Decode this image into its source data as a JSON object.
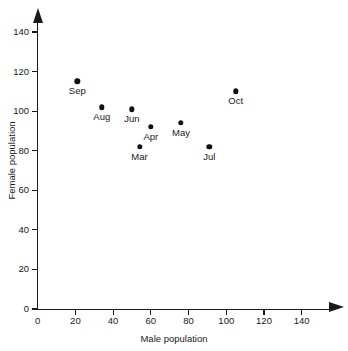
{
  "chart_data": {
    "type": "scatter",
    "title": "",
    "xlabel": "Male population",
    "ylabel": "Female population",
    "xlim": [
      0,
      155
    ],
    "ylim": [
      0,
      148
    ],
    "grid": false,
    "legend": "none",
    "x_ticks": [
      0,
      20,
      40,
      60,
      80,
      100,
      120,
      140
    ],
    "y_ticks": [
      0,
      20,
      40,
      60,
      80,
      100,
      120,
      140
    ],
    "x_tick_labels": [
      "0",
      "20",
      "40",
      "60",
      "80",
      "100",
      "120",
      "140"
    ],
    "y_tick_labels": [
      "0",
      "20",
      "40",
      "60",
      "80",
      "100",
      "120",
      "140"
    ],
    "points": [
      {
        "label": "Sep",
        "x": 21,
        "y": 115,
        "label_pos": "below"
      },
      {
        "label": "Aug",
        "x": 34,
        "y": 102,
        "label_pos": "below"
      },
      {
        "label": "Jun",
        "x": 50,
        "y": 101,
        "label_pos": "below"
      },
      {
        "label": "Apr",
        "x": 60,
        "y": 92,
        "label_pos": "below"
      },
      {
        "label": "Mar",
        "x": 54,
        "y": 82,
        "label_pos": "below"
      },
      {
        "label": "May",
        "x": 76,
        "y": 94,
        "label_pos": "below"
      },
      {
        "label": "Jul",
        "x": 91,
        "y": 82,
        "label_pos": "below"
      },
      {
        "label": "Oct",
        "x": 105,
        "y": 110,
        "label_pos": "below"
      }
    ]
  },
  "axes": {
    "x_title": "Male population",
    "y_title": "Female population"
  },
  "colors": {
    "ink": "#1a1a1a",
    "marker": "#111111",
    "background": "#ffffff"
  }
}
